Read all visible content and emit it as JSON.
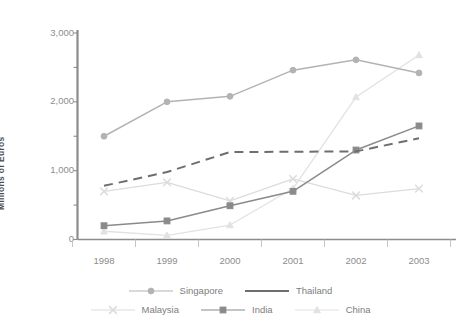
{
  "chart_data": {
    "type": "line",
    "title": "",
    "xlabel": "",
    "ylabel": "Millions of Euros",
    "categories": [
      "1998",
      "1999",
      "2000",
      "2001",
      "2002",
      "2003"
    ],
    "ylim": [
      0,
      3000
    ],
    "ytick_labels": [
      "0",
      "1,000",
      "2,000",
      "3,000"
    ],
    "ytick_values": [
      0,
      1000,
      2000,
      3000
    ],
    "grid": false,
    "legend_position": "bottom",
    "series": [
      {
        "name": "Singapore",
        "values": [
          1500,
          2000,
          2080,
          2460,
          2610,
          2420
        ],
        "color": "#b3b3b3",
        "marker": "circle",
        "dash": "solid"
      },
      {
        "name": "Thailand",
        "values": [
          780,
          980,
          1270,
          1275,
          1280,
          1470
        ],
        "color": "#6e6e6e",
        "marker": "none",
        "dash": "dashed"
      },
      {
        "name": "Malaysia",
        "values": [
          700,
          830,
          560,
          880,
          640,
          740
        ],
        "color": "#dcdcdc",
        "marker": "x",
        "dash": "solid"
      },
      {
        "name": "India",
        "values": [
          200,
          270,
          490,
          700,
          1300,
          1650
        ],
        "color": "#8a8a8a",
        "marker": "square",
        "dash": "solid"
      },
      {
        "name": "China",
        "values": [
          120,
          60,
          210,
          740,
          2070,
          2680
        ],
        "color": "#e2e2e2",
        "marker": "triangle",
        "dash": "solid"
      }
    ]
  },
  "axis": {
    "y_label": "Millions of Euros",
    "y_ticks": [
      "3,000",
      "2,000",
      "1,000",
      "0"
    ],
    "x_ticks": [
      "1998",
      "1999",
      "2000",
      "2001",
      "2002",
      "2003"
    ],
    "axis_color": "#8c8c8c"
  },
  "legend": {
    "row1": [
      {
        "label": "Singapore",
        "color": "#b3b3b3",
        "marker": "circle",
        "dash": "solid"
      },
      {
        "label": "Thailand",
        "color": "#6e6e6e",
        "marker": "none",
        "dash": "solid"
      }
    ],
    "row2": [
      {
        "label": "Malaysia",
        "color": "#dcdcdc",
        "marker": "x",
        "dash": "solid"
      },
      {
        "label": "India",
        "color": "#8a8a8a",
        "marker": "square",
        "dash": "solid"
      },
      {
        "label": "China",
        "color": "#e2e2e2",
        "marker": "triangle",
        "dash": "solid"
      }
    ]
  },
  "cut_title": ""
}
